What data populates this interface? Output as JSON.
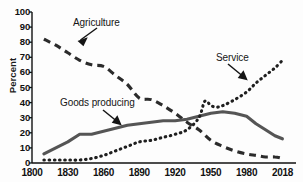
{
  "chart": {
    "title": "",
    "ylabel": "Percent",
    "xlabel": ""
  },
  "axes": {
    "y_ticks": [
      "100",
      "90",
      "80",
      "70",
      "60",
      "50",
      "40",
      "30",
      "20",
      "10",
      "0"
    ],
    "x_ticks": [
      "1800",
      "1830",
      "1860",
      "1890",
      "1920",
      "1950",
      "1980",
      "2018"
    ]
  },
  "labels": {
    "agriculture": "Agriculture",
    "service": "Service",
    "goods": "Goods producing"
  },
  "colors": {
    "ink": "#111111",
    "background": "#fdfdfd",
    "series": "#333333"
  },
  "chart_data": {
    "type": "line",
    "title": "",
    "xlabel": "",
    "ylabel": "Percent",
    "xlim": [
      1800,
      2018
    ],
    "ylim": [
      0,
      100
    ],
    "grid": false,
    "legend": "annotations",
    "x_tick_values": [
      1800,
      1830,
      1860,
      1890,
      1920,
      1950,
      1980,
      2018
    ],
    "y_tick_values": [
      0,
      10,
      20,
      30,
      40,
      50,
      60,
      70,
      80,
      90,
      100
    ],
    "series": [
      {
        "name": "Agriculture",
        "style": "dashed",
        "x": [
          1810,
          1820,
          1830,
          1840,
          1850,
          1860,
          1870,
          1880,
          1890,
          1900,
          1910,
          1920,
          1930,
          1940,
          1950,
          1960,
          1970,
          1980,
          1990,
          2000,
          2010,
          2018
        ],
        "values": [
          82,
          78,
          73,
          68,
          65,
          64,
          58,
          52,
          43,
          42,
          38,
          33,
          27,
          22,
          15,
          11,
          8,
          6,
          5,
          4,
          4,
          3
        ]
      },
      {
        "name": "Goods producing",
        "style": "solid",
        "x": [
          1810,
          1820,
          1830,
          1840,
          1850,
          1860,
          1870,
          1880,
          1890,
          1900,
          1910,
          1920,
          1930,
          1940,
          1950,
          1960,
          1970,
          1980,
          1990,
          2000,
          2010,
          2018
        ],
        "values": [
          6,
          10,
          14,
          19,
          19,
          21,
          23,
          25,
          26,
          27,
          28,
          28,
          29,
          31,
          33,
          34,
          33,
          31,
          26,
          22,
          18,
          16
        ]
      },
      {
        "name": "Service",
        "style": "dotted",
        "x": [
          1810,
          1820,
          1830,
          1840,
          1850,
          1860,
          1870,
          1880,
          1890,
          1900,
          1910,
          1920,
          1930,
          1940,
          1945,
          1950,
          1955,
          1960,
          1970,
          1980,
          1990,
          2000,
          2010,
          2018
        ],
        "values": [
          2,
          2,
          2,
          2,
          3,
          5,
          8,
          11,
          14,
          15,
          17,
          19,
          22,
          30,
          41,
          38,
          37,
          38,
          42,
          47,
          53,
          58,
          63,
          68
        ]
      }
    ],
    "annotations": [
      {
        "text": "Agriculture",
        "points_to_series": "Agriculture"
      },
      {
        "text": "Service",
        "points_to_series": "Service"
      },
      {
        "text": "Goods producing",
        "points_to_series": "Goods producing"
      }
    ]
  }
}
